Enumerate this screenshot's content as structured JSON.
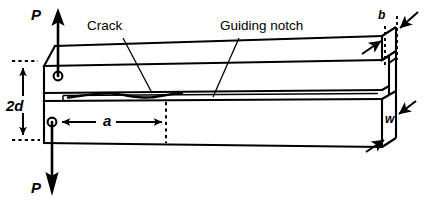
{
  "figure": {
    "kind": "engineering-diagram",
    "width": 431,
    "height": 210,
    "background_color": "#ffffff",
    "line_color": "#000000"
  },
  "labels": {
    "load_top": "P",
    "load_bottom": "P",
    "height_dimension": "2d",
    "crack_length_dimension": "a",
    "thickness_dimension": "b",
    "depth_dimension": "w",
    "crack_callout": "Crack",
    "notch_callout": "Guiding notch"
  },
  "annotations": [
    {
      "name": "load-top",
      "text": "P",
      "role": "applied tensile load, upward arrow at upper pin"
    },
    {
      "name": "load-bottom",
      "text": "P",
      "role": "applied tensile load, downward arrow at lower pin"
    },
    {
      "name": "height",
      "text": "2d",
      "role": "total separation between the two loading pin centres"
    },
    {
      "name": "crack-length",
      "text": "a",
      "role": "crack length measured from loading pin to crack tip"
    },
    {
      "name": "thickness",
      "text": "b",
      "role": "specimen thickness at the notched web, shown on end face"
    },
    {
      "name": "depth",
      "text": "w",
      "role": "specimen depth / width of the end face"
    },
    {
      "name": "crack",
      "text": "Crack",
      "role": "leader line pointing to the wavy crack front inside the notch"
    },
    {
      "name": "notch",
      "text": "Guiding notch",
      "role": "leader line pointing to the side groove along the specimen"
    }
  ],
  "features": {
    "upper_pin": "circular loading hole near the upper-left of the specimen",
    "lower_pin": "circular loading hole near the lower-left of the specimen",
    "chamfer": "diagonal chamfer at the upper-left corner of the specimen",
    "notch_slot": "horizontal slot running along the mid-plane of the specimen",
    "crack_front": "irregular wavy line inside the mid-plane slot",
    "end_face": "isometric stepped end face at the right showing b and w",
    "dimension_style": "dashed extension lines with solid filled arrowheads"
  }
}
